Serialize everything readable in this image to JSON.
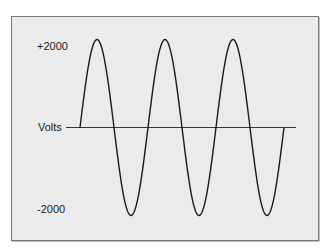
{
  "chart_data": {
    "type": "line",
    "title": "",
    "xlabel": "",
    "ylabel": "Volts",
    "y_tick_labels": [
      "+2000",
      "-2000"
    ],
    "yticks": [
      2000,
      -2000
    ],
    "ylim": [
      -2000,
      2000
    ],
    "grid": false,
    "legend": null,
    "series": [
      {
        "name": "AC voltage (sine wave)",
        "amplitude": 2000,
        "cycles": 3,
        "x": [
          0,
          0.25,
          0.5,
          0.75,
          1.0,
          1.25,
          1.5,
          1.75,
          2.0,
          2.25,
          2.5,
          2.75,
          3.0
        ],
        "values": [
          0,
          2000,
          0,
          -2000,
          0,
          2000,
          0,
          -2000,
          0,
          2000,
          0,
          -2000,
          0
        ]
      }
    ]
  },
  "labels": {
    "top": "+2000",
    "axis": "Volts",
    "bottom": "-2000"
  },
  "colors": {
    "background": "#ebebeb",
    "line": "#1a1a1a",
    "frame": "#7a7a7a"
  }
}
